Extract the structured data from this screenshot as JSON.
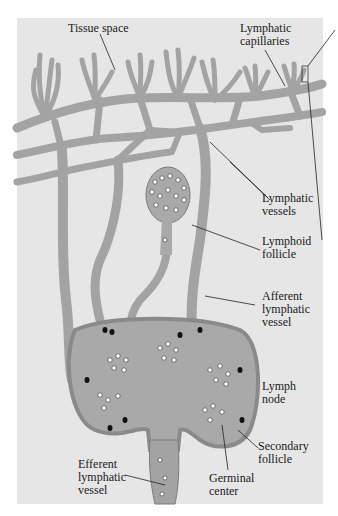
{
  "diagram": {
    "colors": {
      "background": "#ffffff",
      "panel": "#e6e6e6",
      "vessel_fill": "#a3a3a3",
      "vessel_stroke": "#7a7a7a",
      "node_fill": "#a9a9a9",
      "node_capsule": "#8a8a8a",
      "cell_fill": "#ffffff",
      "nucleus": "#111111",
      "leader_line": "#222222"
    },
    "labels": {
      "tissue_space": "Tissue space",
      "lymphatic_capillaries": "Lymphatic\ncapillaries",
      "lymphatic_vessels": "Lymphatic\nvessels",
      "lymphoid_follicle": "Lymphoid\nfollicle",
      "afferent_lymphatic_vessel": "Afferent\nlymphatic\nvessel",
      "lymph_node": "Lymph\nnode",
      "secondary_follicle": "Secondary\nfollicle",
      "germinal_center": "Germinal\ncenter",
      "efferent_lymphatic_vessel": "Efferent\nlymphatic\nvessel"
    }
  }
}
